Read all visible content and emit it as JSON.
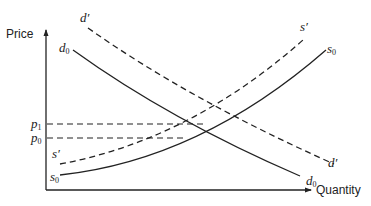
{
  "diagram": {
    "type": "supply-demand",
    "axes": {
      "y_label": "Price",
      "x_label": "Quantity"
    },
    "price_levels": [
      {
        "id": "p1",
        "symbol": "p",
        "subscript": "1"
      },
      {
        "id": "p0",
        "symbol": "p",
        "subscript": "0"
      }
    ],
    "curves": [
      {
        "id": "d0",
        "symbol": "d",
        "subscript": "0",
        "style": "solid",
        "kind": "demand",
        "label_top": "d",
        "label_top_sub": "0",
        "label_bottom": "d",
        "label_bottom_sub": "0"
      },
      {
        "id": "d_prime",
        "symbol": "d′",
        "style": "dashed",
        "kind": "demand",
        "label_top": "d′",
        "label_bottom": "d′"
      },
      {
        "id": "s0",
        "symbol": "s",
        "subscript": "0",
        "style": "solid",
        "kind": "supply",
        "label_top": "s",
        "label_top_sub": "0",
        "label_bottom": "s",
        "label_bottom_sub": "0"
      },
      {
        "id": "s_prime",
        "symbol": "s′",
        "style": "dashed",
        "kind": "supply",
        "label_top": "s′",
        "label_bottom": "s′"
      }
    ],
    "colors": {
      "line": "#222222",
      "background": "#ffffff"
    }
  }
}
